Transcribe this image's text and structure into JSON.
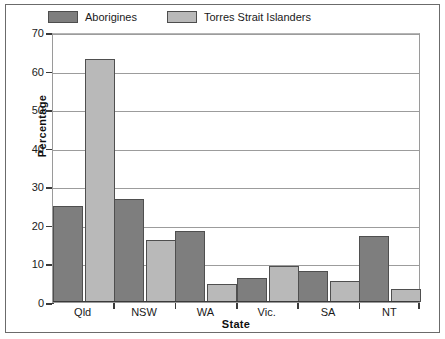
{
  "chart_data": {
    "type": "bar",
    "title": "",
    "xlabel": "State",
    "ylabel": "Percentage",
    "categories": [
      "Qld",
      "NSW",
      "WA",
      "Vic.",
      "SA",
      "NT"
    ],
    "series": [
      {
        "name": "Aborigines",
        "color": "#7e7e7e",
        "values": [
          25,
          26.8,
          18.3,
          6.2,
          8,
          17.2
        ]
      },
      {
        "name": "Torres Strait Islanders",
        "color": "#b9b9b9",
        "values": [
          63,
          16,
          4.6,
          9.4,
          5.5,
          3.4
        ]
      }
    ],
    "ylim": [
      0,
      70
    ],
    "yticks": [
      0,
      10,
      20,
      30,
      40,
      50,
      60,
      70
    ],
    "ytick_labels": [
      "0",
      "10",
      "20",
      "30",
      "40",
      "50",
      "60",
      "70"
    ],
    "grid": true,
    "legend_position": "top-left"
  }
}
